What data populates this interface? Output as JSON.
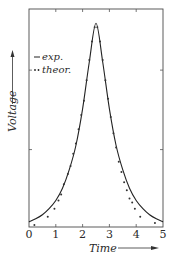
{
  "chart_data": {
    "type": "line",
    "title": "",
    "xlabel": "Time",
    "ylabel": "Voltage",
    "xlim": [
      0,
      5
    ],
    "ylim": [
      0,
      1.07
    ],
    "x_ticks": [
      0,
      1,
      2,
      3,
      4,
      5
    ],
    "x_tick_labels": [
      "0",
      "1",
      "2",
      "3",
      "4",
      "5"
    ],
    "y_ticks_unlabeled": [
      0.38,
      0.77
    ],
    "grid": false,
    "legend_position": "upper-left",
    "series": [
      {
        "name": "exp.",
        "style": "solid-line",
        "x": [
          0,
          0.25,
          0.5,
          0.75,
          1.0,
          1.25,
          1.5,
          1.75,
          2.0,
          2.25,
          2.5,
          2.75,
          3.0,
          3.25,
          3.5,
          3.75,
          4.0,
          4.25,
          4.5,
          4.75,
          5.0
        ],
        "values": [
          0.025,
          0.04,
          0.06,
          0.09,
          0.13,
          0.19,
          0.28,
          0.4,
          0.58,
          0.81,
          1.0,
          0.81,
          0.58,
          0.4,
          0.28,
          0.19,
          0.13,
          0.09,
          0.06,
          0.04,
          0.025
        ]
      },
      {
        "name": "theor.",
        "style": "dots",
        "x": [
          0.2,
          0.7,
          0.95,
          1.1,
          1.2,
          1.3,
          1.45,
          1.55,
          1.65,
          1.75,
          1.85,
          1.95,
          2.05,
          2.15,
          2.25,
          2.35,
          2.45,
          2.55,
          2.65,
          2.75,
          2.85,
          2.95,
          3.05,
          3.15,
          3.25,
          3.35,
          3.45,
          3.55,
          3.65,
          3.75,
          3.85,
          3.95,
          4.15,
          4.7
        ],
        "values": [
          0.01,
          0.05,
          0.09,
          0.13,
          0.16,
          0.21,
          0.26,
          0.3,
          0.36,
          0.41,
          0.48,
          0.55,
          0.62,
          0.72,
          0.82,
          0.91,
          0.98,
          0.98,
          0.91,
          0.82,
          0.72,
          0.63,
          0.54,
          0.46,
          0.39,
          0.32,
          0.27,
          0.22,
          0.18,
          0.14,
          0.12,
          0.09,
          0.05,
          0.02
        ]
      }
    ],
    "legend": [
      "exp.",
      "theor."
    ]
  },
  "labels": {
    "x_axis": "Time",
    "y_axis": "Voltage",
    "legend_exp": "exp.",
    "legend_theor": "theor."
  }
}
